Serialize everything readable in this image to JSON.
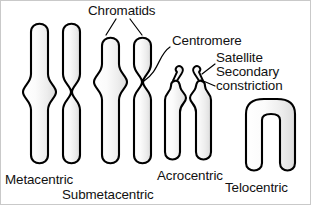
{
  "figure": {
    "background_color": "#ffffff",
    "outline_color": "#000000",
    "fill_color": "#f2f2f2"
  },
  "annotations": {
    "chromatids": "Chromatids",
    "centromere": "Centromere",
    "satellite": "Satellite",
    "secondary": "Secondary",
    "constriction": "constriction"
  },
  "chromosomes": [
    {
      "id": "metacentric",
      "label": "Metacentric",
      "centromere_position": "middle",
      "arm_ratio": "equal arms",
      "shape": "X-shaped"
    },
    {
      "id": "submetacentric",
      "label": "Submetacentric",
      "centromere_position": "off-center toward one end",
      "arm_ratio": "short arms and long arms",
      "shape": "X-shaped with unequal arms"
    },
    {
      "id": "acrocentric",
      "label": "Acrocentric",
      "centromere_position": "near one end",
      "arm_ratio": "very short arms with satellites",
      "shape": "inverted-U with satellite stalks"
    },
    {
      "id": "telocentric",
      "label": "Telocentric",
      "centromere_position": "terminal end",
      "arm_ratio": "single arm pair",
      "shape": "inverted-U"
    }
  ]
}
